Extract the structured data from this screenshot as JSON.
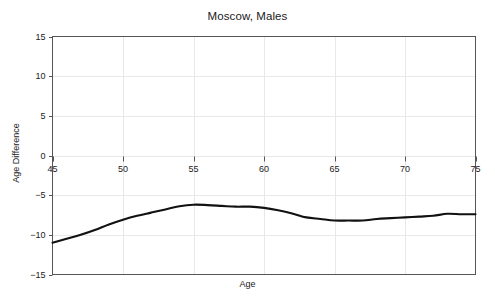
{
  "chart_data": {
    "type": "line",
    "title": "Moscow, Males",
    "xlabel": "Age",
    "ylabel": "Age Difference",
    "xlim": [
      45,
      75
    ],
    "ylim": [
      -15,
      15
    ],
    "xticks": [
      45,
      50,
      55,
      60,
      65,
      70,
      75
    ],
    "yticks": [
      15,
      10,
      5,
      0,
      -5,
      -10,
      -15
    ],
    "xtick_labels": [
      "45",
      "50",
      "55",
      "60",
      "65",
      "70",
      "75"
    ],
    "ytick_labels": [
      "15",
      "10",
      "5",
      "0",
      "-5",
      "-10",
      "-15"
    ],
    "grid": true,
    "grid_color": "#e8e8e8",
    "legend": null,
    "series": [
      {
        "name": "Age Difference",
        "color": "#111111",
        "line_width": 2.1,
        "x": [
          45,
          46,
          47,
          48,
          49,
          50,
          51,
          52,
          53,
          54,
          55,
          56,
          57,
          58,
          59,
          60,
          61,
          62,
          63,
          64,
          65,
          66,
          67,
          68,
          69,
          70,
          71,
          72,
          73,
          74,
          75
        ],
        "values": [
          -11.0,
          -10.5,
          -10.0,
          -9.4,
          -8.7,
          -8.1,
          -7.6,
          -7.2,
          -6.8,
          -6.4,
          -6.2,
          -6.25,
          -6.35,
          -6.45,
          -6.45,
          -6.6,
          -6.9,
          -7.3,
          -7.8,
          -8.0,
          -8.2,
          -8.2,
          -8.2,
          -8.0,
          -7.9,
          -7.8,
          -7.7,
          -7.6,
          -7.35,
          -7.4,
          -7.4
        ]
      }
    ]
  },
  "axes": {
    "frame_color": "#555555",
    "background": "#ffffff"
  }
}
